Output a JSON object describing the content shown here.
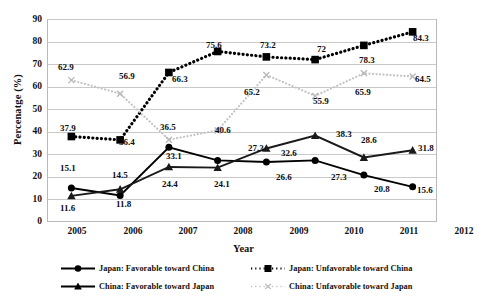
{
  "chart_data": {
    "type": "line",
    "title": "",
    "xlabel": "Year",
    "ylabel": "Percenatge (%)",
    "categories": [
      "2005",
      "2006",
      "2007",
      "2008",
      "2009",
      "2010",
      "2011",
      "2012"
    ],
    "ylim": [
      0,
      90
    ],
    "yticks": [
      "0",
      "10",
      "20",
      "30",
      "40",
      "50",
      "60",
      "70",
      "80",
      "90"
    ],
    "grid": true,
    "legend_position": "bottom",
    "series": [
      {
        "name": "Japan: Favorable toward China",
        "marker": "circle",
        "line": "solid",
        "color": "#000000",
        "values": [
          15.1,
          11.8,
          33.1,
          27.3,
          26.6,
          27.3,
          20.8,
          15.6
        ],
        "labels": [
          "15.1",
          "11.8",
          "33.1",
          "27.3",
          "26.6",
          "27.3",
          "20.8",
          "15.6"
        ]
      },
      {
        "name": "Japan: Unfavorable toward China",
        "marker": "square",
        "line": "dotted",
        "color": "#000000",
        "values": [
          37.9,
          36.4,
          66.3,
          75.6,
          73.2,
          72,
          78.3,
          84.3
        ],
        "labels": [
          "37.9",
          "36.4",
          "66.3",
          "75.6",
          "73.2",
          "72",
          "78.3",
          "84.3"
        ]
      },
      {
        "name": "China: Favorable toward Japan",
        "marker": "triangle",
        "line": "solid",
        "color": "#1a1a1a",
        "values": [
          11.6,
          14.5,
          24.4,
          24.1,
          32.6,
          38.3,
          28.6,
          31.8
        ],
        "labels": [
          "11.6",
          "14.5",
          "24.4",
          "24.1",
          "32.6",
          "38.3",
          "28.6",
          "31.8"
        ]
      },
      {
        "name": "China: Unfavorable toward Japan",
        "marker": "x",
        "line": "dotted-light",
        "color": "#c3c3c3",
        "values": [
          62.9,
          56.9,
          36.5,
          40.6,
          65.2,
          55.9,
          65.9,
          64.5
        ],
        "labels": [
          "62.9",
          "56.9",
          "36.5",
          "40.6",
          "65.2",
          "55.9",
          "65.9",
          "64.5"
        ]
      }
    ]
  },
  "axis": {
    "y_title": "Percenatge (%)",
    "x_title": "Year",
    "y_ticks": [
      "90",
      "80",
      "70",
      "60",
      "50",
      "40",
      "30",
      "20",
      "10",
      "0"
    ],
    "x_ticks": [
      "2005",
      "2006",
      "2007",
      "2008",
      "2009",
      "2010",
      "2011",
      "2012"
    ]
  },
  "legend": {
    "items": [
      {
        "label": "Japan: Favorable toward China",
        "style": "solid-circle"
      },
      {
        "label": "Japan: Unfavorable toward China",
        "style": "dotted-square"
      },
      {
        "label": "China: Favorable toward Japan",
        "style": "solid-triangle"
      },
      {
        "label": "China: Unfavorable toward Japan",
        "style": "dotted-x"
      }
    ]
  },
  "data_labels": {
    "jf": [
      "15.1",
      "11.8",
      "33.1",
      "27.3",
      "26.6",
      "27.3",
      "20.8",
      "15.6"
    ],
    "ju": [
      "37.9",
      "36.4",
      "66.3",
      "75.6",
      "73.2",
      "72",
      "78.3",
      "84.3"
    ],
    "cf": [
      "11.6",
      "14.5",
      "24.4",
      "24.1",
      "32.6",
      "38.3",
      "28.6",
      "31.8"
    ],
    "cu": [
      "62.9",
      "56.9",
      "36.5",
      "40.6",
      "65.2",
      "55.9",
      "65.9",
      "64.5"
    ]
  }
}
